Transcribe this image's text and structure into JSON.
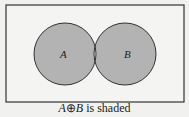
{
  "diagram": {
    "type": "venn",
    "sets": [
      {
        "label": "A"
      },
      {
        "label": "B"
      }
    ],
    "shaded": "symmetric difference (A and B excluding intersection)",
    "colors": {
      "fill": "#b3b3b3",
      "background": "#f1f1ef",
      "stroke": "#333333"
    }
  },
  "caption": {
    "set_a": "A",
    "operator": "⊕",
    "set_b": "B",
    "text": " is shaded"
  }
}
